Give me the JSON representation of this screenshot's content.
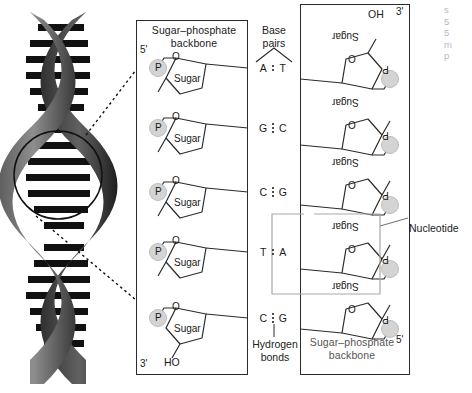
{
  "figure": {
    "helix_alt": "grayscale DNA double helix with circular magnification callout"
  },
  "left_panel": {
    "title": "Sugar–phosphate\nbackbone",
    "five_prime": "5'",
    "three_prime": "3'",
    "terminal_hydroxyl": "HO",
    "phosphate_label": "P",
    "sugar_label": "Sugar",
    "oxygen_label": "O",
    "units": [
      {
        "phosphate": "P",
        "sugar": "Sugar",
        "oxygen": "O"
      },
      {
        "phosphate": "P",
        "sugar": "Sugar",
        "oxygen": "O"
      },
      {
        "phosphate": "P",
        "sugar": "Sugar",
        "oxygen": "O"
      },
      {
        "phosphate": "P",
        "sugar": "Sugar",
        "oxygen": "O"
      },
      {
        "phosphate": "P",
        "sugar": "Sugar",
        "oxygen": "O"
      }
    ]
  },
  "right_panel": {
    "title": "Sugar–phosphate\nbackbone",
    "five_prime": "5'",
    "three_prime": "3'",
    "terminal_hydroxyl": "OH",
    "phosphate_label": "P",
    "sugar_label": "Sugar",
    "oxygen_label": "O",
    "units": [
      {
        "phosphate": "P",
        "sugar": "Sugar",
        "oxygen": "O"
      },
      {
        "phosphate": "P",
        "sugar": "Sugar",
        "oxygen": "O"
      },
      {
        "phosphate": "P",
        "sugar": "Sugar",
        "oxygen": "O"
      },
      {
        "phosphate": "P",
        "sugar": "Sugar",
        "oxygen": "O"
      },
      {
        "phosphate": "P",
        "sugar": "Sugar",
        "oxygen": "O"
      }
    ]
  },
  "base_pairs": {
    "header": "Base\npairs",
    "hydrogen_bond_label": "Hydrogen\nbonds",
    "pairs": [
      {
        "left": "A",
        "right": "T",
        "bonds": 2
      },
      {
        "left": "G",
        "right": "C",
        "bonds": 3
      },
      {
        "left": "C",
        "right": "G",
        "bonds": 3
      },
      {
        "left": "T",
        "right": "A",
        "bonds": 2
      },
      {
        "left": "C",
        "right": "G",
        "bonds": 3
      }
    ]
  },
  "annotations": {
    "nucleotide": "Nucleotide",
    "cut_caption": "s\n5\n5\nm\np"
  },
  "colors": {
    "stroke": "#2b2b2b",
    "text": "#1a1a1a",
    "phosphate_fill": "#d4d4d4",
    "helix_dark": "#2f2f2f",
    "helix_mid": "#6e6e6e",
    "highlight_box": "#a8a8a8"
  }
}
